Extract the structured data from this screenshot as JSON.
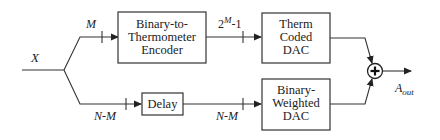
{
  "diagram": {
    "input": {
      "label": "X"
    },
    "top_path": {
      "bus_label": "M",
      "encoder": {
        "line1": "Binary-to-",
        "line2": "Thermometer",
        "line3": "Encoder"
      },
      "bus_label_2_base": "2",
      "bus_label_2_sup": "M",
      "bus_label_2_tail": "-1",
      "dac": {
        "line1": "Therm",
        "line2": "Coded",
        "line3": "DAC"
      }
    },
    "bottom_path": {
      "bus_label": "N-M",
      "delay": {
        "label": "Delay"
      },
      "bus_label_2": "N-M",
      "dac": {
        "line1": "Binary-",
        "line2": "Weighted",
        "line3": "DAC"
      }
    },
    "summer": {
      "symbol": "+"
    },
    "output": {
      "label_base": "A",
      "label_sub": "out"
    }
  }
}
